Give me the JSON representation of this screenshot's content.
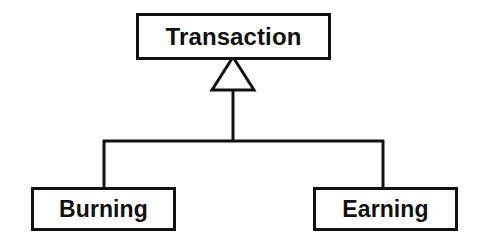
{
  "diagram": {
    "type": "uml-class-diagram",
    "relationship": "generalization",
    "background_color": "#ffffff",
    "stroke_color": "#111111",
    "parent": {
      "name": "Transaction",
      "label": "Transaction"
    },
    "children": [
      {
        "name": "Burning",
        "label": "Burning"
      },
      {
        "name": "Earning",
        "label": "Earning"
      }
    ],
    "connector": {
      "arrow_type": "hollow-triangle",
      "apex_x": 233,
      "apex_y": 58,
      "base_y": 90,
      "base_left_x": 212,
      "base_right_x": 254,
      "stem_x": 233,
      "stem_top_y": 90,
      "stem_bottom_y": 141,
      "bus_y": 141,
      "bus_left_x": 104,
      "bus_right_x": 383,
      "left_drop_bottom_y": 188,
      "right_drop_bottom_y": 188
    }
  }
}
